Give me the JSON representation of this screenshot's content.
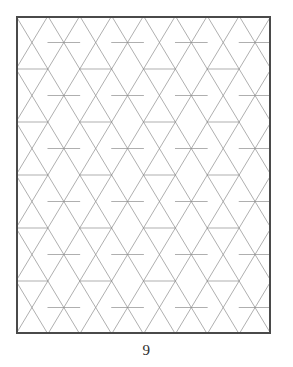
{
  "page": {
    "number_label": "9",
    "background_color": "#ffffff"
  },
  "figure": {
    "name": "herringbone-parallelogram-tiling",
    "border_color": "#4a4a4a",
    "border_width_px": 2,
    "line_color": "#8d8d8d",
    "line_width_px": 0.7,
    "fill_color": "#ffffff",
    "frame": {
      "x": 16,
      "y": 16,
      "width": 255,
      "height": 318
    }
  },
  "chart_data": {
    "type": "diagram",
    "title": "",
    "geometry": {
      "cell_width": 63.75,
      "cell_height": 53.0,
      "row_step": 26.5,
      "diagonal_angle_deg": 60,
      "rows": 12,
      "columns": 4
    },
    "grid": true,
    "legend": "none"
  }
}
